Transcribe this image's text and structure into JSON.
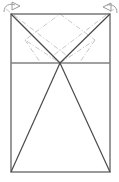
{
  "figure": {
    "canvas": {
      "width": 119,
      "height": 182,
      "background": "#ffffff"
    },
    "colors": {
      "solid_line": "#4a4a4a",
      "outline": "#808080",
      "dashdot_line": "#c8c8c8",
      "arrow": "#9a9a9a",
      "background": "#ffffff"
    },
    "line_widths": {
      "outline": 1.6,
      "solid": 1.2,
      "dashdot": 1.0,
      "arrow": 1.0
    },
    "dash_pattern": "5 2 1 2",
    "points": {
      "rect_top_left": {
        "x": 11,
        "y": 14
      },
      "rect_top_right": {
        "x": 110,
        "y": 14
      },
      "rect_bottom_left": {
        "x": 11,
        "y": 172
      },
      "rect_bottom_right": {
        "x": 110,
        "y": 172
      },
      "divider_left": {
        "x": 11,
        "y": 63
      },
      "divider_right": {
        "x": 110,
        "y": 63
      },
      "apex": {
        "x": 60,
        "y": 63
      },
      "top_mid": {
        "x": 60,
        "y": 14
      },
      "diamond_left": {
        "x": 25,
        "y": 40
      },
      "diamond_right": {
        "x": 95,
        "y": 40
      }
    },
    "shapes": {
      "outer_rectangle": {
        "name": "outer-rectangle",
        "x": 11,
        "y": 14,
        "width": 99,
        "height": 158,
        "style": "outline"
      },
      "divider_line": {
        "name": "horizontal-divider",
        "x1": 11,
        "y1": 63,
        "x2": 110,
        "y2": 63,
        "style": "outline"
      },
      "upper_left_diagonal": {
        "name": "upper-left-diagonal",
        "x1": 11,
        "y1": 14,
        "x2": 60,
        "y2": 63,
        "style": "solid"
      },
      "upper_right_diagonal": {
        "name": "upper-right-diagonal",
        "x1": 110,
        "y1": 14,
        "x2": 60,
        "y2": 63,
        "style": "solid"
      },
      "lower_left_leg": {
        "name": "lower-left-triangle-leg",
        "x1": 60,
        "y1": 63,
        "x2": 11,
        "y2": 172,
        "style": "solid"
      },
      "lower_right_leg": {
        "name": "lower-right-triangle-leg",
        "x1": 60,
        "y1": 63,
        "x2": 110,
        "y2": 172,
        "style": "solid"
      },
      "diamond": {
        "name": "dashdot-diamond",
        "vertices": [
          {
            "x": 60,
            "y": 14
          },
          {
            "x": 95,
            "y": 40
          },
          {
            "x": 60,
            "y": 63
          },
          {
            "x": 25,
            "y": 40
          }
        ],
        "style": "dashdot"
      },
      "dashdot_left_extension": {
        "name": "dashdot-left-extension",
        "x1": 6,
        "y1": 9,
        "x2": 70,
        "y2": 58,
        "style": "dashdot"
      },
      "dashdot_right_extension": {
        "name": "dashdot-right-extension",
        "x1": 114,
        "y1": 9,
        "x2": 50,
        "y2": 58,
        "style": "dashdot"
      },
      "dashdot_left_low": {
        "name": "dashdot-left-lower-branch",
        "x1": 25,
        "y1": 40,
        "x2": 40,
        "y2": 62,
        "style": "dashdot"
      },
      "dashdot_right_low": {
        "name": "dashdot-right-lower-branch",
        "x1": 95,
        "y1": 40,
        "x2": 80,
        "y2": 62,
        "style": "dashdot"
      }
    },
    "arrows": [
      {
        "name": "left-arrowhead",
        "tip": {
          "x": 20,
          "y": 6
        },
        "direction": "right",
        "tail_path": "M 4 12 C 4 5, 10 3, 15 5",
        "head_path": "M 12 2 L 20 6 L 12 10 Z"
      },
      {
        "name": "right-arrowhead",
        "tip": {
          "x": 103,
          "y": 7
        },
        "direction": "left",
        "tail_path": "M 117 13 C 117 6, 112 4, 107 5",
        "head_path": "M 111 3 L 103 7 L 111 11 Z"
      }
    ]
  }
}
